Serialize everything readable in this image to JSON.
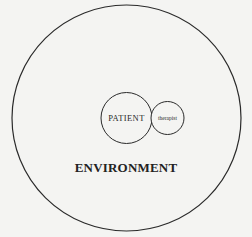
{
  "diagram": {
    "colors": {
      "background": "#f4f4f2",
      "stroke": "#2a2a2a",
      "text": "#222222"
    },
    "environment": {
      "label": "ENVIRONMENT",
      "shape": "circle",
      "contains": [
        "patient",
        "therapist"
      ]
    },
    "patient": {
      "label": "PATIENT",
      "shape": "circle"
    },
    "therapist": {
      "label": "therapist",
      "shape": "circle",
      "relation": "adjacent to patient, smaller"
    }
  }
}
